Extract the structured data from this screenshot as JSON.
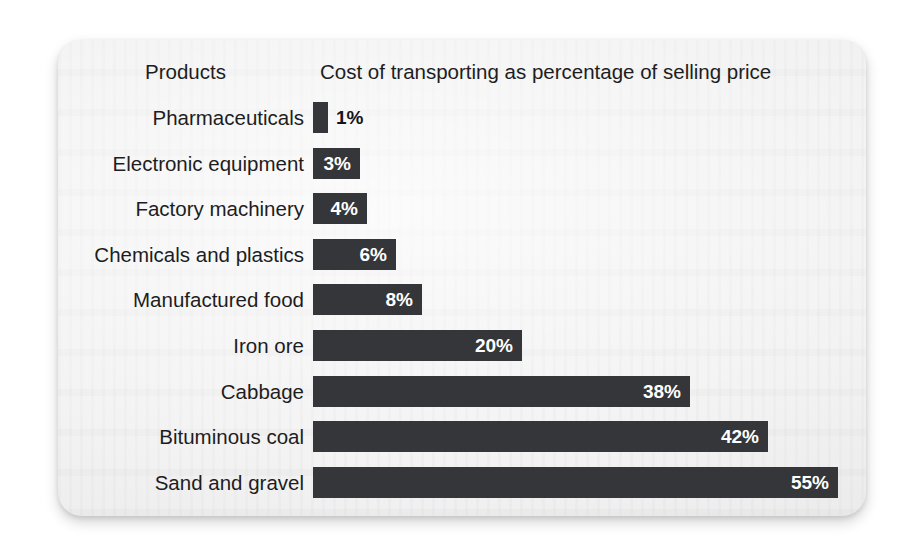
{
  "card": {
    "background_color": "#f1f1f1",
    "bar_color": "#343639",
    "text_color": "#1d1d1f",
    "value_label_color_inside": "#ffffff",
    "value_label_color_outside": "#141416"
  },
  "header": {
    "category_column": "Products",
    "value_column": "Cost of transporting as percentage of selling price"
  },
  "chart_data": {
    "type": "bar",
    "orientation": "horizontal",
    "title": "Cost of transporting as percentage of selling price",
    "xlabel": "Cost of transporting as percentage of selling price",
    "ylabel": "Products",
    "grid": false,
    "legend": "none",
    "xlim": [
      0,
      55
    ],
    "unit": "%",
    "categories": [
      "Pharmaceuticals",
      "Electronic equipment",
      "Factory machinery",
      "Chemicals and plastics",
      "Manufactured food",
      "Iron ore",
      "Cabbage",
      "Bituminous coal",
      "Sand and gravel"
    ],
    "values": [
      1,
      3,
      4,
      6,
      8,
      20,
      38,
      42,
      55
    ],
    "data_labels": [
      "1%",
      "3%",
      "4%",
      "6%",
      "8%",
      "20%",
      "38%",
      "42%",
      "55%"
    ],
    "label_placement": [
      "outside",
      "inside",
      "inside",
      "inside",
      "inside",
      "inside",
      "inside",
      "inside",
      "inside"
    ]
  },
  "rows": [
    {
      "label": "Pharmaceuticals",
      "value": 1,
      "display": "1%",
      "bar_px": 15,
      "outside": true
    },
    {
      "label": "Electronic equipment",
      "value": 3,
      "display": "3%",
      "bar_px": 47,
      "outside": false
    },
    {
      "label": "Factory machinery",
      "value": 4,
      "display": "4%",
      "bar_px": 54,
      "outside": false
    },
    {
      "label": "Chemicals and plastics",
      "value": 6,
      "display": "6%",
      "bar_px": 83,
      "outside": false
    },
    {
      "label": "Manufactured food",
      "value": 8,
      "display": "8%",
      "bar_px": 109,
      "outside": false
    },
    {
      "label": "Iron ore",
      "value": 20,
      "display": "20%",
      "bar_px": 209,
      "outside": false
    },
    {
      "label": "Cabbage",
      "value": 38,
      "display": "38%",
      "bar_px": 377,
      "outside": false
    },
    {
      "label": "Bituminous coal",
      "value": 42,
      "display": "42%",
      "bar_px": 455,
      "outside": false
    },
    {
      "label": "Sand and gravel",
      "value": 55,
      "display": "55%",
      "bar_px": 525,
      "outside": false
    }
  ]
}
